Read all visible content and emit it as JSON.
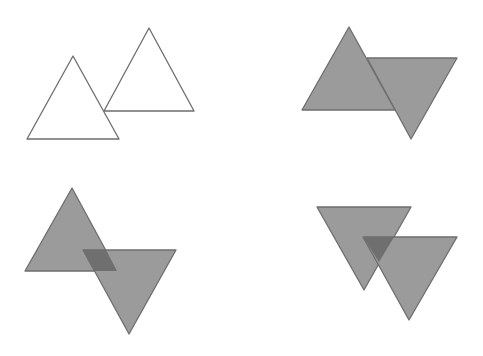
{
  "canvas": {
    "width": 483,
    "height": 356,
    "background": "#ffffff"
  },
  "colors": {
    "fill": "#9b9b9b",
    "overlap": "#6f6f6f",
    "stroke": "#6e6e6e",
    "outline_fill": "#ffffff"
  },
  "panels": [
    {
      "id": "outlines",
      "triangles": [
        {
          "points": "149,28 104,111 194,111",
          "style": "outline"
        },
        {
          "points": "73,56 27,139 119,139",
          "style": "outline"
        }
      ],
      "overlap": null
    },
    {
      "id": "union",
      "triangles": [
        {
          "points": "367,58 457,58 411,139",
          "style": "filled"
        },
        {
          "points": "349,27 302,110 395,110",
          "style": "filled"
        }
      ],
      "overlap": null
    },
    {
      "id": "intersection-parallelogram",
      "triangles": [
        {
          "points": "72,188 25,271 117,271",
          "style": "filled"
        },
        {
          "points": "83,250 176,250 129,334",
          "style": "filled"
        }
      ],
      "overlap": {
        "points": "83,250 106,250 117,271 94,271"
      }
    },
    {
      "id": "intersection-triangle",
      "triangles": [
        {
          "points": "317,207 411,207 364,290",
          "style": "filled"
        },
        {
          "points": "363,237 457,237 409,320",
          "style": "filled"
        }
      ],
      "overlap": {
        "points": "363,237 394,237 379,262"
      }
    }
  ]
}
